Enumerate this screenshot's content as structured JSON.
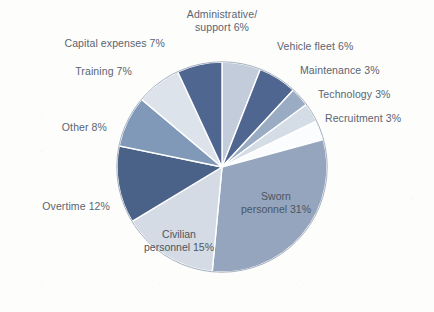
{
  "chart_data": {
    "type": "pie",
    "title": "",
    "subtitle": "",
    "xlabel": "",
    "ylabel": "",
    "legend_position": "none",
    "grid": false,
    "units": "percent",
    "start_angle_deg": 0,
    "direction": "clockwise",
    "categories": [
      "Administrative/ support",
      "Vehicle fleet",
      "Maintenance",
      "Technology",
      "Recruitment",
      "Sworn personnel",
      "Civilian personnel",
      "Overtime",
      "Other",
      "Training",
      "Capital expenses"
    ],
    "values": [
      6,
      6,
      3,
      3,
      3,
      31,
      15,
      12,
      8,
      7,
      7
    ],
    "colors": [
      "#c3ccda",
      "#4f6690",
      "#9aacc4",
      "#d4dce6",
      "#fbfcfd",
      "#94a5bd",
      "#d4dbe4",
      "#4a6287",
      "#8199b8",
      "#dde3eb",
      "#4f6690"
    ],
    "slices": [
      {
        "label": "Administrative/\nsupport 6%",
        "name": "Administrative/ support",
        "value": 6,
        "color": "#c3ccda"
      },
      {
        "label": "Vehicle fleet 6%",
        "name": "Vehicle fleet",
        "value": 6,
        "color": "#4f6690"
      },
      {
        "label": "Maintenance 3%",
        "name": "Maintenance",
        "value": 3,
        "color": "#9aacc4"
      },
      {
        "label": "Technology 3%",
        "name": "Technology",
        "value": 3,
        "color": "#d4dce6"
      },
      {
        "label": "Recruitment 3%",
        "name": "Recruitment",
        "value": 3,
        "color": "#fbfcfd"
      },
      {
        "label": "Sworn\npersonnel 31%",
        "name": "Sworn personnel",
        "value": 31,
        "color": "#94a5bd"
      },
      {
        "label": "Civilian\npersonnel 15%",
        "name": "Civilian personnel",
        "value": 15,
        "color": "#d4dbe4"
      },
      {
        "label": "Overtime 12%",
        "name": "Overtime",
        "value": 12,
        "color": "#4a6287"
      },
      {
        "label": "Other 8%",
        "name": "Other",
        "value": 8,
        "color": "#8199b8"
      },
      {
        "label": "Training 7%",
        "name": "Training",
        "value": 7,
        "color": "#dde3eb"
      },
      {
        "label": "Capital expenses 7%",
        "name": "Capital expenses",
        "value": 7,
        "color": "#4f6690"
      }
    ]
  },
  "labels": {
    "administrative": "Administrative/\nsupport 6%",
    "vehicle_fleet": "Vehicle fleet 6%",
    "maintenance": "Maintenance 3%",
    "technology": "Technology 3%",
    "recruitment": "Recruitment 3%",
    "sworn_personnel": "Sworn\npersonnel 31%",
    "civilian_personnel": "Civilian\npersonnel 15%",
    "overtime": "Overtime 12%",
    "other": "Other 8%",
    "training": "Training 7%",
    "capital_expenses": "Capital expenses 7%"
  }
}
